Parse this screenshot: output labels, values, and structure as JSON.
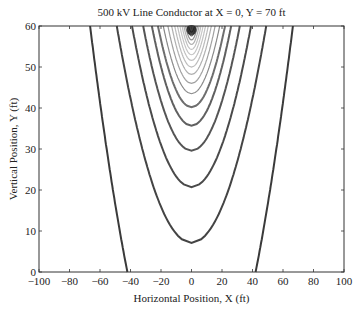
{
  "chart_data": {
    "type": "contour",
    "title": "500 kV Line Conductor at X = 0, Y = 70 ft",
    "xlabel": "Horizontal Position, X (ft)",
    "ylabel": "Vertical Position, Y (ft)",
    "xlim": [
      -100,
      100
    ],
    "ylim": [
      0,
      60
    ],
    "xticks": [
      -100,
      -80,
      -60,
      -40,
      -20,
      0,
      20,
      40,
      60,
      80,
      100
    ],
    "yticks": [
      0,
      10,
      20,
      30,
      40,
      50,
      60
    ],
    "grid": false,
    "conductor": {
      "x": 0,
      "y": 70
    },
    "contours": [
      {
        "y_min": -40,
        "x_at_top": 66.5,
        "x_at_zero": 45,
        "color": "#3a3a3a"
      },
      {
        "y_min": 7.1,
        "x_at_top": 49,
        "color": "#444444"
      },
      {
        "y_min": 20.7,
        "x_at_top": 39,
        "color": "#4a4a4a"
      },
      {
        "y_min": 29.6,
        "x_at_top": 31.7,
        "color": "#555555"
      },
      {
        "y_min": 35.7,
        "x_at_top": 26,
        "color": "#606060"
      },
      {
        "y_min": 40.2,
        "x_at_top": 22,
        "color": "#6e6e6e"
      },
      {
        "y_min": 43.5,
        "x_at_top": 18.5,
        "color": "#8a8a8a"
      },
      {
        "y_min": 46.0,
        "x_at_top": 15.5,
        "color": "#a0a0a0"
      },
      {
        "y_min": 48.2,
        "x_at_top": 13,
        "color": "#b0b0b0"
      },
      {
        "y_min": 50.0,
        "x_at_top": 11,
        "color": "#bbbbbb"
      },
      {
        "y_min": 51.6,
        "x_at_top": 9.2,
        "color": "#c2c2c2"
      },
      {
        "y_min": 53.0,
        "x_at_top": 7.6,
        "color": "#c6c6c6"
      },
      {
        "y_min": 54.3,
        "x_at_top": 6.2,
        "color": "#c0c0c0"
      },
      {
        "y_min": 55.5,
        "x_at_top": 5.0,
        "color": "#b0b0b0"
      },
      {
        "y_min": 56.6,
        "x_at_top": 3.9,
        "color": "#909090"
      },
      {
        "y_min": 57.6,
        "x_at_top": 2.9,
        "color": "#606060"
      },
      {
        "y_min": 58.5,
        "x_at_top": 2.0,
        "color": "#303030"
      }
    ]
  }
}
